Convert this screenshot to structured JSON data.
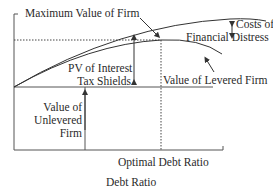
{
  "diagram": {
    "labels": {
      "max_value": "Maximum Value of Firm",
      "costs_distress_line1": "Costs of",
      "costs_distress_line2": "Financial Distress",
      "pv_tax_line1": "PV of Interest",
      "pv_tax_line2": "Tax Shields",
      "levered_value": "Value of Levered Firm",
      "unlevered_line1": "Value of",
      "unlevered_line2": "Unlevered",
      "unlevered_line3": "Firm",
      "optimal_debt": "Optimal Debt Ratio",
      "x_axis": "Debt Ratio"
    },
    "colors": {
      "line": "#333333",
      "text": "#2a2a2a",
      "background": "#ffffff"
    }
  }
}
